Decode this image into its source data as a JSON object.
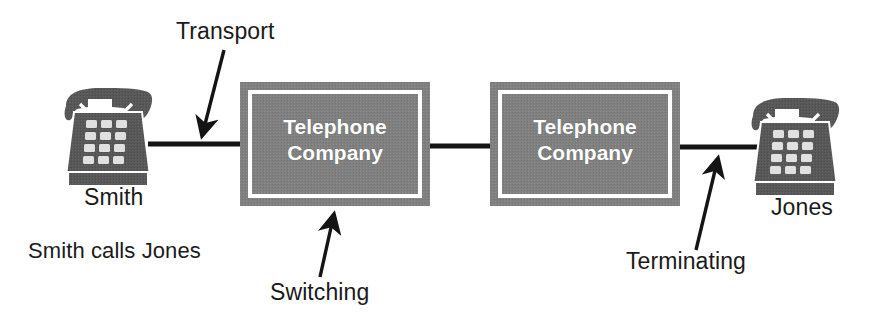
{
  "diagram": {
    "title_caption": "Smith calls Jones",
    "nodes": [
      {
        "name": "telephone-company-1",
        "line1": "Telephone",
        "line2": "Company",
        "fill": "#808080",
        "inner_border": "#ffffff"
      },
      {
        "name": "telephone-company-2",
        "line1": "Telephone",
        "line2": "Company",
        "fill": "#808080",
        "inner_border": "#ffffff"
      }
    ],
    "endpoints": [
      {
        "name": "smith",
        "label": "Smith"
      },
      {
        "name": "jones",
        "label": "Jones"
      }
    ],
    "annotations": [
      {
        "name": "transport",
        "label": "Transport"
      },
      {
        "name": "switching",
        "label": "Switching"
      },
      {
        "name": "terminating",
        "label": "Terminating"
      }
    ],
    "colors": {
      "background": "#ffffff",
      "ink": "#1a1a1a",
      "line": "#141414",
      "box_fill": "#808080",
      "box_inner_border": "#ffffff",
      "phone_body": "#585858",
      "phone_key": "#e0e0e0",
      "node_label": "#ffffff"
    }
  }
}
